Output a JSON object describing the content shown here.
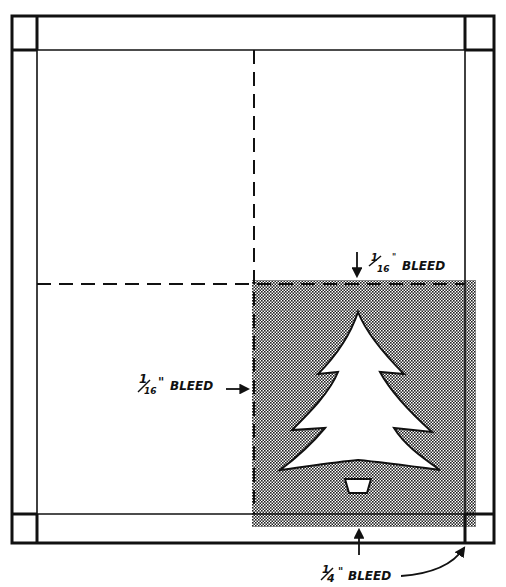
{
  "diagram": {
    "colors": {
      "ink": "#111111",
      "paper": "#ffffff",
      "shade": "#8a8a8a"
    },
    "labels": {
      "top_bleed": {
        "fraction_num": "1",
        "fraction_den": "16",
        "text": "BLEED"
      },
      "left_bleed": {
        "fraction_num": "1",
        "fraction_den": "16",
        "text": "BLEED"
      },
      "bottom_bleed": {
        "fraction_num": "1",
        "fraction_den": "4",
        "text": "BLEED"
      }
    },
    "marks": {
      "inch": "\""
    },
    "icons": [
      "christmas-tree-icon",
      "tree-pot-icon",
      "arrow-down-icon",
      "arrow-right-icon",
      "arrow-up-icon",
      "curved-arrow-icon"
    ]
  }
}
